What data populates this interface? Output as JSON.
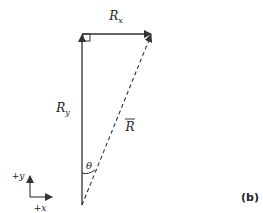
{
  "figure": {
    "panel_label": "(b)",
    "orientation": "flipped-vertical",
    "vectors": {
      "rx_label": "R",
      "rx_sub": "x",
      "ry_label": "R",
      "ry_sub": "y",
      "resultant_label": "R"
    },
    "angle_label": "θ",
    "axes": {
      "x_label": "+x",
      "y_label": "+y"
    },
    "colors": {
      "line": "#333333",
      "background": "#ffffff"
    }
  }
}
